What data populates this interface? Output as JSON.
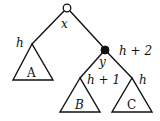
{
  "diagram": {
    "type": "binary-tree-rotation",
    "nodes": [
      {
        "id": "x",
        "label": "x",
        "style": "open-circle"
      },
      {
        "id": "y",
        "label": "y",
        "style": "filled-circle",
        "height_label": "h + 2"
      }
    ],
    "subtrees": [
      {
        "id": "A",
        "label": "A",
        "height_label": "h",
        "parent": "x"
      },
      {
        "id": "B",
        "label": "B",
        "height_label": "h + 1",
        "parent": "y"
      },
      {
        "id": "C",
        "label": "C",
        "height_label": "h",
        "parent": "y"
      }
    ],
    "edges": [
      {
        "from": "x",
        "to": "A"
      },
      {
        "from": "x",
        "to": "y"
      },
      {
        "from": "y",
        "to": "B"
      },
      {
        "from": "y",
        "to": "C"
      }
    ],
    "colors": {
      "stroke": "#111111",
      "filled_node": "#111111",
      "open_node": "#ffffff"
    }
  }
}
